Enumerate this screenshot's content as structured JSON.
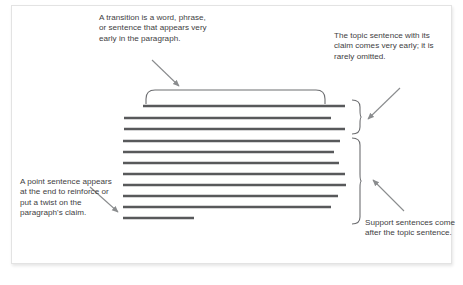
{
  "figure": {
    "background_color": "#ffffff",
    "card_border_color": "#e3e3e3",
    "line_color": "#58595b",
    "bracket_color": "#6d6e71",
    "text_color": "#414042"
  },
  "callouts": {
    "transition": "A transition is a word, phrase, or sentence that appears very early in the paragraph.",
    "topic": "The topic sentence with its claim comes very early; it is rarely omitted.",
    "point": "A point sentence appears at the end to reinforce or put a twist on the paragraph's claim.",
    "support": "Support sentences come after the topic sentence."
  },
  "paragraph_lines": [
    {
      "id": "line-1",
      "x1": 143,
      "x2": 345,
      "y": 106,
      "group": "topic"
    },
    {
      "id": "line-2",
      "x1": 124,
      "x2": 331,
      "y": 118,
      "group": "topic"
    },
    {
      "id": "line-3",
      "x1": 124,
      "x2": 345,
      "y": 129,
      "group": "topic"
    },
    {
      "id": "line-4",
      "x1": 123,
      "x2": 340,
      "y": 141,
      "group": "support"
    },
    {
      "id": "line-5",
      "x1": 123,
      "x2": 334,
      "y": 152,
      "group": "support"
    },
    {
      "id": "line-6",
      "x1": 123,
      "x2": 339,
      "y": 163,
      "group": "support"
    },
    {
      "id": "line-7",
      "x1": 123,
      "x2": 345,
      "y": 174,
      "group": "support"
    },
    {
      "id": "line-8",
      "x1": 123,
      "x2": 346,
      "y": 185,
      "group": "support"
    },
    {
      "id": "line-9",
      "x1": 123,
      "x2": 338,
      "y": 196,
      "group": "support"
    },
    {
      "id": "line-10",
      "x1": 123,
      "x2": 331,
      "y": 207,
      "group": "support"
    },
    {
      "id": "line-11",
      "x1": 123,
      "x2": 194,
      "y": 218,
      "group": "point"
    }
  ],
  "brackets": {
    "transition": {
      "label": "transition-bracket",
      "x1": 146,
      "x2": 325,
      "y_top": 90,
      "y_bottom": 104
    },
    "topic": {
      "label": "topic-bracket",
      "x_left": 352,
      "x_right": 360,
      "y_top": 100,
      "y_bottom": 134
    },
    "support": {
      "label": "support-bracket",
      "x_left": 352,
      "x_right": 360,
      "y_top": 138,
      "y_bottom": 224
    }
  },
  "arrows": [
    {
      "name": "transition-arrow",
      "from_x": 152,
      "from_y": 60,
      "to_x": 179,
      "to_y": 86
    },
    {
      "name": "topic-arrow",
      "from_x": 400,
      "from_y": 88,
      "to_x": 368,
      "to_y": 119
    },
    {
      "name": "point-arrow",
      "from_x": 90,
      "from_y": 187,
      "to_x": 118,
      "to_y": 212
    },
    {
      "name": "support-arrow",
      "from_x": 404,
      "from_y": 211,
      "to_x": 373,
      "to_y": 180
    }
  ]
}
